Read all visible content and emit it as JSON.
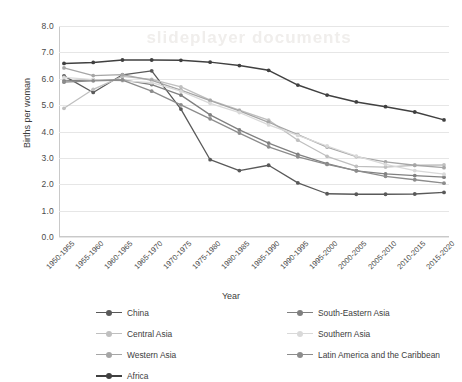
{
  "watermark": {
    "text": "slideplayer  documents"
  },
  "chart_data": {
    "type": "line",
    "title": "",
    "xlabel": "Year",
    "ylabel": "Births per woman",
    "ylim": [
      0.0,
      8.0
    ],
    "ytick_step": 1.0,
    "grid": true,
    "legend_position": "bottom",
    "ytick_labels": [
      "8.0",
      "7.0",
      "6.0",
      "5.0",
      "4.0",
      "3.0",
      "2.0",
      "1.0",
      "0.0"
    ],
    "categories": [
      "1950-1955",
      "1955-1960",
      "1960-1965",
      "1965-1970",
      "1970-1975",
      "1975-1980",
      "1980-1985",
      "1985-1990",
      "1990-1995",
      "1995-2000",
      "2000-2005",
      "2005-2010",
      "2010-2015",
      "2015-2020"
    ],
    "series": [
      {
        "name": "China",
        "color": "#595959",
        "values": [
          6.11,
          5.48,
          6.15,
          6.3,
          4.85,
          2.93,
          2.52,
          2.72,
          2.05,
          1.64,
          1.62,
          1.62,
          1.63,
          1.69
        ]
      },
      {
        "name": "Central Asia",
        "color": "#bfbfbf",
        "values": [
          4.88,
          5.6,
          6.09,
          5.98,
          5.69,
          5.19,
          4.81,
          4.43,
          3.67,
          3.06,
          2.68,
          2.65,
          2.72,
          2.73
        ]
      },
      {
        "name": "Western Asia",
        "color": "#a6a6a6",
        "values": [
          6.41,
          6.12,
          6.16,
          5.94,
          5.57,
          5.17,
          4.78,
          4.35,
          3.88,
          3.41,
          3.05,
          2.85,
          2.72,
          2.63
        ]
      },
      {
        "name": "Africa",
        "color": "#404040",
        "values": [
          6.58,
          6.62,
          6.71,
          6.71,
          6.7,
          6.63,
          6.5,
          6.32,
          5.76,
          5.38,
          5.12,
          4.94,
          4.74,
          4.44
        ]
      },
      {
        "name": "South-Eastern Asia",
        "color": "#808080",
        "values": [
          5.92,
          5.96,
          5.96,
          5.78,
          5.38,
          4.63,
          4.06,
          3.56,
          3.13,
          2.78,
          2.51,
          2.39,
          2.33,
          2.27
        ]
      },
      {
        "name": "Southern Asia",
        "color": "#d9d9d9",
        "values": [
          6.05,
          5.97,
          5.92,
          5.85,
          5.53,
          5.07,
          4.72,
          4.25,
          3.85,
          3.45,
          3.07,
          2.75,
          2.52,
          2.38
        ]
      },
      {
        "name": "Latin America and the Caribbean",
        "color": "#8c8c8c",
        "values": [
          5.87,
          5.92,
          5.95,
          5.53,
          5.01,
          4.48,
          3.94,
          3.42,
          3.04,
          2.75,
          2.52,
          2.3,
          2.17,
          2.04
        ]
      }
    ]
  },
  "legend": {
    "column_a": [
      "China",
      "Central Asia",
      "Western Asia",
      "Africa"
    ],
    "column_b": [
      "South-Eastern Asia",
      "Southern Asia",
      "Latin America and the Caribbean"
    ]
  }
}
